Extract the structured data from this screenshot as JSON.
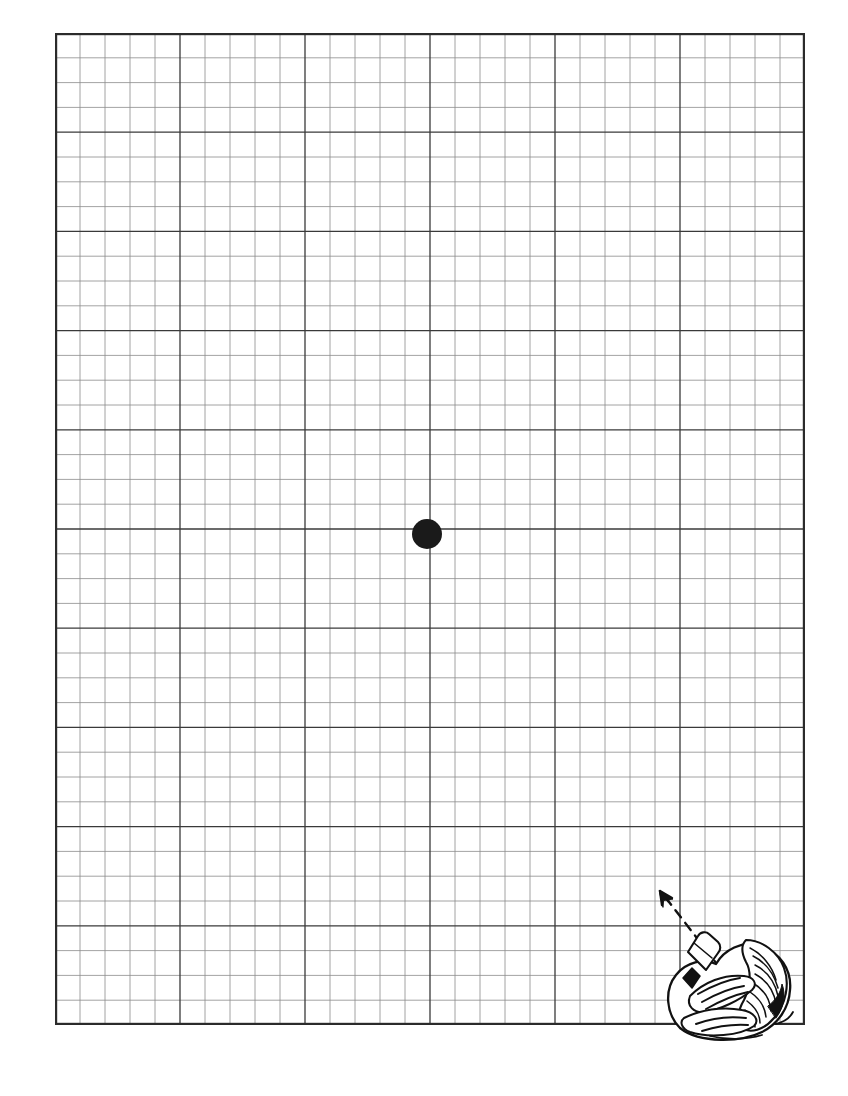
{
  "document": {
    "title": "Amsler Grid Vision Test Chart",
    "type": "amsler-grid",
    "background_color": "#ffffff",
    "page_width": 848,
    "page_height": 1096
  },
  "grid": {
    "name": "amsler-grid",
    "left": 55,
    "top": 33,
    "width": 750,
    "height": 992,
    "columns": 30,
    "rows": 40,
    "cell_width": 25,
    "cell_height": 24.8,
    "minor_line_color": "#8c8c8c",
    "minor_line_width": 0.8,
    "major_line_color": "#3a3a3a",
    "major_line_width": 1.3,
    "border_color": "#2b2b2b",
    "border_width": 2.2,
    "major_every_column": 5,
    "major_every_row": 4
  },
  "fixation_dot": {
    "name": "central-fixation-dot",
    "center_x": 427,
    "center_y": 534,
    "diameter": 30,
    "color": "#1a1a1a"
  },
  "illustration": {
    "name": "hands-holding-card-illustration",
    "description": "Line drawing of two cupped hands holding a card",
    "left": 650,
    "top": 878,
    "width": 175,
    "height": 165,
    "ink_color": "#111111",
    "arrow": {
      "name": "dashed-direction-arrow",
      "description": "Dashed arrow pointing up and to the left toward the grid center",
      "start_x": 70,
      "start_y": 90,
      "end_x": 10,
      "end_y": 14,
      "dash_pattern": "9 7",
      "stroke_width": 2.4
    }
  },
  "chart_data": {
    "type": "table",
    "xlabel": "",
    "ylabel": "",
    "categories": [],
    "values": [],
    "grid": true,
    "legend": "none",
    "annotations": [
      "Central black fixation dot at grid center",
      "Dashed arrow from hands illustration pointing toward grid"
    ]
  }
}
